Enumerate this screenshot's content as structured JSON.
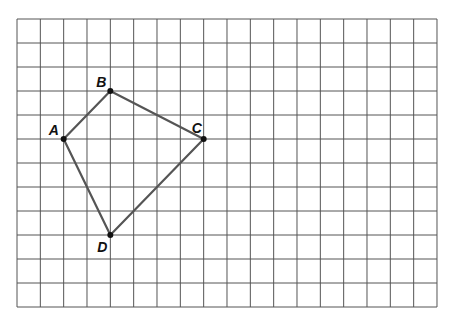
{
  "diagram": {
    "type": "quadrilateral-on-grid",
    "grid": {
      "columns": 18,
      "rows": 12,
      "origin_px": [
        17,
        19
      ],
      "cell_w_px": 23.333,
      "cell_h_px": 24,
      "line_color": "#555555"
    },
    "edge_color": "#555555",
    "points": [
      {
        "label": "A",
        "col": 2,
        "row": 5,
        "label_dx": -15,
        "label_dy": -4
      },
      {
        "label": "B",
        "col": 4,
        "row": 3,
        "label_dx": -14,
        "label_dy": -4
      },
      {
        "label": "C",
        "col": 8,
        "row": 5,
        "label_dx": -12,
        "label_dy": -6
      },
      {
        "label": "D",
        "col": 4,
        "row": 9,
        "label_dx": -13,
        "label_dy": 17
      }
    ],
    "edges": [
      [
        "A",
        "B"
      ],
      [
        "B",
        "C"
      ],
      [
        "C",
        "D"
      ],
      [
        "D",
        "A"
      ]
    ]
  }
}
